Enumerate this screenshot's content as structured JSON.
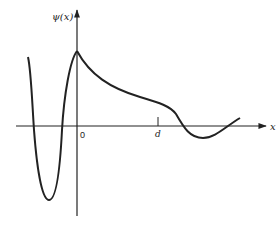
{
  "diagram": {
    "y_axis_label": "ψ(x)",
    "x_axis_label": "x",
    "origin_label": "0",
    "marker_label": "d",
    "colors": {
      "stroke": "#222222",
      "background": "#ffffff"
    }
  }
}
